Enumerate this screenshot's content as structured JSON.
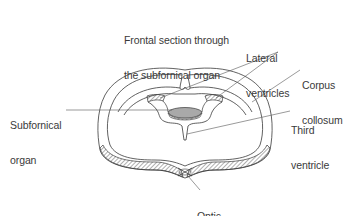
{
  "title": {
    "line1": "Frontal section through",
    "line2": "the subfornical organ"
  },
  "labels": {
    "lateral_ventricles": {
      "line1": "Lateral",
      "line2": "ventricles"
    },
    "corpus_collosum": {
      "line1": "Corpus",
      "line2": "collosum"
    },
    "subfornical_organ": {
      "line1": "Subfornical",
      "line2": "organ"
    },
    "third_ventricle": {
      "line1": "Third",
      "line2": "ventricle"
    },
    "optic_chiasm": {
      "line1": "Optic",
      "line2": "chiasm"
    }
  },
  "colors": {
    "line": "#3a3a3a",
    "organ_fill": "#a9a9a9",
    "background": "#ffffff"
  }
}
